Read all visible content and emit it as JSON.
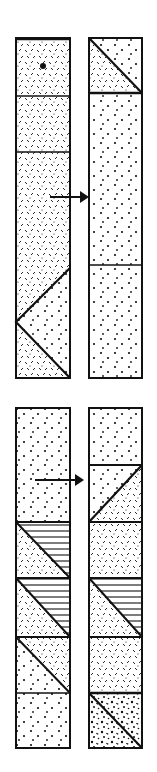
{
  "figure": {
    "colors": {
      "ink": "#111111",
      "background": "#ffffff"
    },
    "patterns": {
      "dots": "sparse-dot-stipple",
      "dashes": "random-dash-texture",
      "hatch": "horizontal-line-hatch",
      "blotch": "dense-blotchy-stipple"
    }
  },
  "diagrams": [
    {
      "name": "upper-pair",
      "arrow": {
        "direction": "right"
      },
      "left_column": [
        "dashes-with-dot-marker",
        "dashes",
        "dashes",
        "dashes",
        "dashes-dots-wedge-V"
      ],
      "right_column": [
        "diagonal-dots-over-dashes",
        "dots",
        "dots"
      ]
    },
    {
      "name": "lower-pair",
      "arrow": {
        "direction": "right"
      },
      "left_column": [
        "dots",
        "hatch-over-dashes-diagonal",
        "hatch-over-dashes-diagonal",
        "dashes-over-dots-diagonal",
        "dots"
      ],
      "right_column": [
        "dots",
        "dots-over-dashes-diagonal",
        "dashes",
        "hatch-over-dashes-diagonal",
        "dashes",
        "dashes-over-blotch-diagonal"
      ]
    }
  ]
}
